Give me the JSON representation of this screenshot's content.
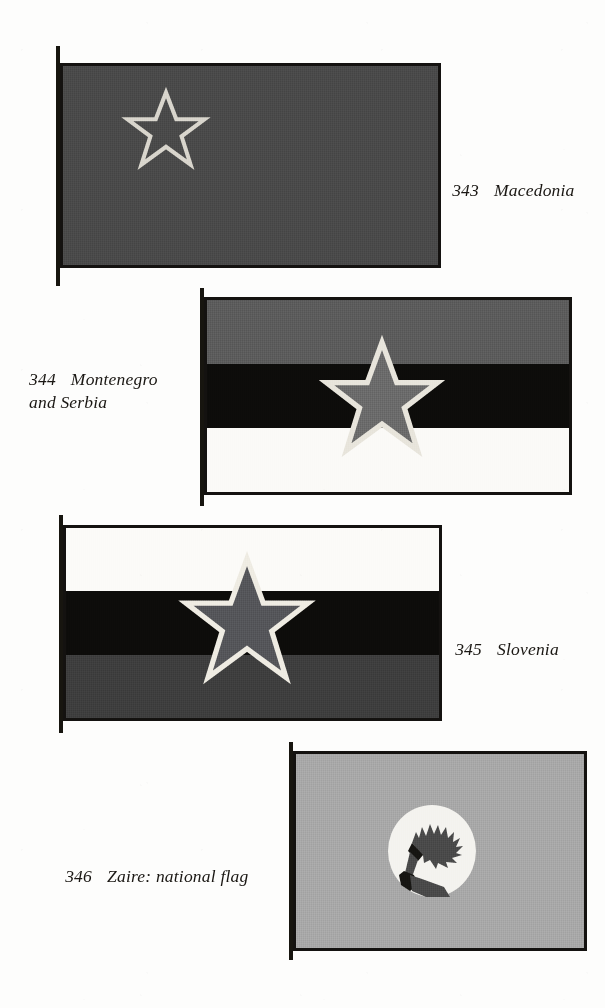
{
  "page": {
    "background_color": "#fdfdfc",
    "ink_color": "#1a1713"
  },
  "figures": [
    {
      "id": "macedonia",
      "number": "343",
      "name": "Macedonia",
      "caption_text": "Macedonia",
      "flag_description": "solid dark red field with hollow outlined five-pointed star in upper hoist",
      "field_color": "#4a4a4a",
      "star_style": "outline",
      "star_color": "#d9d6cd",
      "caption_position": "right",
      "caption_lines": [
        "Macedonia"
      ]
    },
    {
      "id": "montenegro-and-serbia",
      "number": "344",
      "name": "Montenegro and Serbia",
      "caption_text": "Montenegro and Serbia",
      "flag_description": "horizontal tricolour grey over black over white with filled outlined star centred",
      "stripes": [
        {
          "color": "#5c5c5c",
          "label": "grey"
        },
        {
          "color": "#0d0c0a",
          "label": "black"
        },
        {
          "color": "#fbfaf7",
          "label": "white"
        }
      ],
      "star_style": "filled",
      "star_color": "#6b6b6b",
      "star_outline_color": "#e8e5dc",
      "caption_position": "left",
      "caption_lines": [
        "Montenegro",
        "and Serbia"
      ]
    },
    {
      "id": "slovenia",
      "number": "345",
      "name": "Slovenia",
      "caption_text": "Slovenia",
      "flag_description": "horizontal tricolour white over black over grey with filled outlined star centred",
      "stripes": [
        {
          "color": "#fcfbf8",
          "label": "white"
        },
        {
          "color": "#0d0c0a",
          "label": "black"
        },
        {
          "color": "#3e3e3e",
          "label": "grey"
        }
      ],
      "star_style": "filled",
      "star_color": "#55565a",
      "star_outline_color": "#efece3",
      "caption_position": "right",
      "caption_lines": [
        "Slovenia"
      ]
    },
    {
      "id": "zaire",
      "number": "346",
      "name": "Zaire: national flag",
      "caption_text": "Zaire: national flag",
      "flag_description": "plain light grey-green field with central white disc bearing an arm holding a flaming torch",
      "field_color": "#a8a8a8",
      "disc_color": "#f4f3ef",
      "emblem_color": "#4a4a4a",
      "emblem_name": "arm-holding-torch",
      "caption_position": "left",
      "caption_lines": [
        "Zaire: national flag"
      ]
    }
  ]
}
